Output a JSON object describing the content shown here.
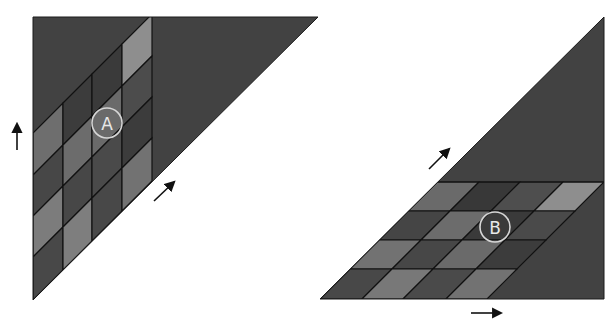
{
  "canvas": {
    "width": 614,
    "height": 325,
    "background": "#ffffff"
  },
  "colors": {
    "triangle_fill": "#424242",
    "grid_line": "#111111",
    "outline": "#1a1a1a",
    "label_ring": "#d6d6d6",
    "label_text": "#e8e8e8",
    "arrow": "#111111"
  },
  "diagram_a": {
    "label": "A",
    "triangle": [
      [
        33,
        17
      ],
      [
        318,
        17
      ],
      [
        33,
        300
      ]
    ],
    "columns_x": [
      33,
      63,
      92,
      122,
      152
    ],
    "diagonal_offsets_at_left_edge": [
      133,
      175,
      216,
      257,
      300
    ],
    "cells_by_column": [
      [
        "#6e6e6e",
        "#474747",
        "#7c7c7c",
        "#484848"
      ],
      [
        "#3c3c3c",
        "#6c6c6c",
        "#474747",
        "#7e7e7e"
      ],
      [
        "#3a3a3a",
        "#6a6a6a",
        "#4a4a4a",
        "#484848"
      ],
      [
        "#8e8e8e",
        "#4c4c4c",
        "#3c3c3c",
        "#727272"
      ]
    ],
    "label_circle": {
      "cx": 107,
      "cy": 123,
      "r": 15
    },
    "arrows": [
      {
        "name": "up-arrow",
        "from": [
          17,
          150
        ],
        "to": [
          17,
          124
        ]
      },
      {
        "name": "diagonal-arrow",
        "from": [
          154,
          201
        ],
        "to": [
          174,
          182
        ]
      }
    ]
  },
  "diagram_b": {
    "label": "B",
    "triangle": [
      [
        320,
        299
      ],
      [
        604,
        299
      ],
      [
        604,
        17
      ]
    ],
    "rows_y": [
      182,
      211,
      240,
      269,
      299
    ],
    "diagonal_offsets_at_bottom_edge": [
      320,
      362,
      403,
      446,
      487
    ],
    "cells_by_row": [
      [
        "#6a6a6a",
        "#383838",
        "#4e4e4e",
        "#8e8e8e"
      ],
      [
        "#454545",
        "#6c6c6c",
        "#3a3a3a",
        "#4a4a4a"
      ],
      [
        "#727272",
        "#474747",
        "#6a6a6a",
        "#3c3c3c"
      ],
      [
        "#484848",
        "#787878",
        "#4a4a4a",
        "#727272"
      ]
    ],
    "label_circle": {
      "cx": 495,
      "cy": 227,
      "r": 15
    },
    "arrows": [
      {
        "name": "diagonal-arrow",
        "from": [
          429,
          169
        ],
        "to": [
          449,
          149
        ]
      },
      {
        "name": "right-arrow",
        "from": [
          471,
          313
        ],
        "to": [
          501,
          313
        ]
      }
    ]
  }
}
